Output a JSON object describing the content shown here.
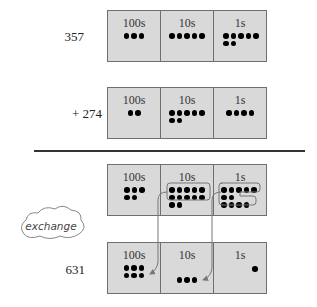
{
  "diagram": {
    "type": "place-value-addition",
    "columns": [
      "100s",
      "10s",
      "1s"
    ],
    "rows": [
      {
        "label": "357",
        "dots": {
          "hundreds": 3,
          "tens": 5,
          "ones": 7
        }
      },
      {
        "label": "+ 274",
        "dots": {
          "hundreds": 2,
          "tens": 7,
          "ones": 4
        }
      },
      {
        "label": "",
        "dots": {
          "hundreds": 5,
          "tens": 12,
          "ones": 11
        },
        "grouped": {
          "tens": 10,
          "ones": 10
        }
      },
      {
        "label": "631",
        "dots": {
          "hundreds": 6,
          "tens": 3,
          "ones": 1
        }
      }
    ],
    "exchange_label": "exchange"
  },
  "colors": {
    "box_fill": "#d9d9d9",
    "border": "#6f6f6f",
    "dot": "#000000",
    "rule": "#333333"
  }
}
